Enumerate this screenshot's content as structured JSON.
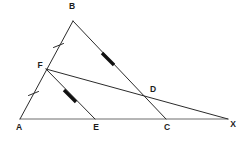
{
  "figure": {
    "type": "geometry-diagram",
    "background_color": "#ffffff",
    "line_color": "#2b2b2b",
    "base_line_color": "#6d6d6d",
    "marker_color": "#111111",
    "label_color": "#1c1c1c",
    "points": {
      "A": {
        "label": "A",
        "x": 20,
        "y": 119,
        "label_x": 19,
        "label_y": 128
      },
      "B": {
        "label": "B",
        "x": 73,
        "y": 21,
        "label_x": 72,
        "label_y": 7
      },
      "C": {
        "label": "C",
        "x": 166,
        "y": 119,
        "label_x": 167,
        "label_y": 128
      },
      "D": {
        "label": "D",
        "x": 145,
        "y": 92,
        "label_x": 150,
        "label_y": 90
      },
      "E": {
        "label": "E",
        "x": 95,
        "y": 119,
        "label_x": 96,
        "label_y": 128
      },
      "F": {
        "label": "F",
        "x": 46,
        "y": 69,
        "label_x": 40,
        "label_y": 66
      },
      "X": {
        "label": "X",
        "x": 228,
        "y": 119,
        "label_x": 233,
        "label_y": 125
      }
    },
    "segments": [
      {
        "name": "segment-AB",
        "from": "A",
        "to": "B",
        "style": "plain"
      },
      {
        "name": "segment-BC-extended-to-X",
        "from": "B",
        "to": "X",
        "style": "plain"
      },
      {
        "name": "segment-AX-base",
        "from": "A",
        "to": "X",
        "style": "base"
      },
      {
        "name": "segment-FX",
        "from": "F",
        "to": "X",
        "style": "plain"
      },
      {
        "name": "segment-FE",
        "from": "F",
        "to": "E",
        "style": "plain"
      }
    ],
    "tick_marks": [
      {
        "name": "tick-on-FB",
        "x": 58.5,
        "y": 45.5,
        "segment": "FB",
        "count": 1
      },
      {
        "name": "tick-on-AF",
        "x": 33.5,
        "y": 93.5,
        "segment": "AF",
        "count": 1
      }
    ],
    "arrow_marks": [
      {
        "name": "arrow-on-BD",
        "x1": 102,
        "y1": 53,
        "x2": 114,
        "y2": 65,
        "segment": "BD"
      },
      {
        "name": "arrow-on-FE",
        "x1": 64,
        "y1": 90,
        "x2": 76,
        "y2": 102,
        "segment": "FE"
      }
    ],
    "annotations": {
      "equal_marks_note": "single tick on AF and on FB indicates AF = FB",
      "parallel_marks_note": "arrow marks on BD and FE indicate BD parallel to FE"
    }
  }
}
